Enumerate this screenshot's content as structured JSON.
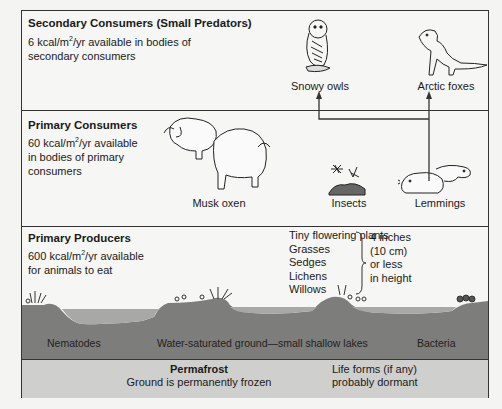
{
  "secondary_consumers": {
    "title": "Secondary Consumers (Small Predators)",
    "desc_prefix": "6 kcal/m",
    "desc_sup": "2",
    "desc_line1_suffix": "/yr available in bodies of",
    "desc_line2": "secondary consumers",
    "animals": [
      {
        "name": "Snowy owls",
        "icon": "owl-icon"
      },
      {
        "name": "Arctic foxes",
        "icon": "fox-icon"
      }
    ]
  },
  "primary_consumers": {
    "title": "Primary Consumers",
    "desc_prefix": "60 kcal/m",
    "desc_sup": "2",
    "desc_line1_suffix": "/yr available",
    "desc_line2": "in bodies of primary",
    "desc_line3": "consumers",
    "animals": [
      {
        "name": "Musk oxen",
        "icon": "musk-ox-icon"
      },
      {
        "name": "Insects",
        "icon": "insect-icon"
      },
      {
        "name": "Lemmings",
        "icon": "lemming-icon"
      }
    ]
  },
  "primary_producers": {
    "title": "Primary Producers",
    "desc_prefix": "600 kcal/m",
    "desc_sup": "2",
    "desc_line1_suffix": "/yr available",
    "desc_line2": "for animals to eat",
    "plants": [
      "Tiny flowering plants",
      "Grasses",
      "Sedges",
      "Lichens",
      "Willows"
    ],
    "height_note": [
      "4 inches",
      "(10 cm)",
      "or less",
      "in height"
    ]
  },
  "ground": {
    "left_label": "Nematodes",
    "center_label": "Water-saturated ground—small shallow lakes",
    "right_label": "Bacteria"
  },
  "permafrost": {
    "title": "Permafrost",
    "subtitle": "Ground is permanently frozen",
    "life_line1": "Life forms (if any)",
    "life_line2": "probably dormant"
  },
  "colors": {
    "ground": "#7d7d7b",
    "water": "#a8a8a6",
    "permafrost": "#cfcfcd",
    "border": "#333333"
  }
}
